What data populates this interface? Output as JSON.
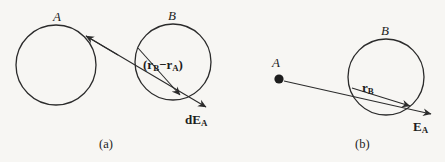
{
  "figure": {
    "background_color": "#f7f6f3",
    "stroke_color": "#2b2b2b",
    "text_color": "#1d1d1d"
  },
  "panel_a": {
    "caption": "(a)",
    "circle_a_label": "A",
    "circle_b_label": "B",
    "separation_vector_open": "(",
    "separation_vector_r_b": "r",
    "separation_vector_sub_b": "B",
    "separation_vector_minus": "−",
    "separation_vector_r_a": "r",
    "separation_vector_sub_a": "A",
    "separation_vector_close": ")",
    "field_label_main": "dE",
    "field_label_sub": "A",
    "circle_a": {
      "cx": 56,
      "cy": 65,
      "r": 40
    },
    "circle_b": {
      "cx": 173,
      "cy": 62,
      "r": 38
    },
    "arrow_back_tip": {
      "x": 84,
      "y": 34
    },
    "arrow_inner_tip": {
      "x": 182,
      "y": 96
    },
    "arrow_outer_tip": {
      "x": 212,
      "y": 110
    }
  },
  "panel_b": {
    "caption": "(b)",
    "point_a_label": "A",
    "circle_b_label": "B",
    "position_vector_main": "r",
    "position_vector_sub": "B",
    "field_label_main": "E",
    "field_label_sub": "A",
    "point_a_dot": {
      "cx": 279,
      "cy": 79,
      "r": 4.6
    },
    "circle_b": {
      "cx": 386,
      "cy": 77,
      "r": 38
    },
    "arrow_inner_tip": {
      "x": 414,
      "y": 108
    },
    "arrow_outer_tip": {
      "x": 437,
      "y": 116
    }
  }
}
